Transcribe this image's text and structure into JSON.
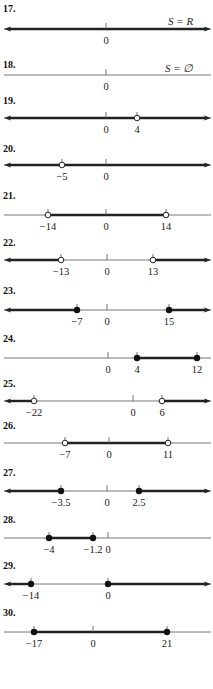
{
  "colors": {
    "axis": "#666666",
    "ray": "#222222",
    "dot": "#111111",
    "text": "#222222",
    "background": "#ffffff"
  },
  "problems": [
    {
      "number": "17.",
      "label_y": 12,
      "line_y": 29,
      "x0": 4,
      "x1": 211,
      "ticks": [
        {
          "x": 106,
          "label": "0"
        }
      ],
      "segments": [
        {
          "from": 4,
          "to": 211,
          "arrow_left": true,
          "arrow_right": true
        }
      ],
      "points": [],
      "annotation": {
        "text": "S = R",
        "x": 168,
        "y": 25
      }
    },
    {
      "number": "18.",
      "label_y": 68,
      "line_y": 75,
      "x0": 4,
      "x1": 211,
      "ticks": [
        {
          "x": 106,
          "label": "0"
        }
      ],
      "segments": [],
      "points": [],
      "annotation": {
        "text": "S = ∅",
        "x": 165,
        "y": 72
      }
    },
    {
      "number": "19.",
      "label_y": 104,
      "line_y": 118,
      "x0": 4,
      "x1": 211,
      "ticks": [
        {
          "x": 106,
          "label": "0"
        },
        {
          "x": 137,
          "label": "4"
        }
      ],
      "segments": [
        {
          "from": 4,
          "to": 211,
          "arrow_left": true,
          "arrow_right": true
        }
      ],
      "points": [
        {
          "x": 137,
          "type": "open"
        }
      ]
    },
    {
      "number": "20.",
      "label_y": 152,
      "line_y": 165,
      "x0": 4,
      "x1": 211,
      "ticks": [
        {
          "x": 62,
          "label": "−5"
        },
        {
          "x": 106,
          "label": "0"
        }
      ],
      "segments": [
        {
          "from": 4,
          "to": 211,
          "arrow_left": true,
          "arrow_right": true
        }
      ],
      "points": [
        {
          "x": 62,
          "type": "open"
        }
      ]
    },
    {
      "number": "21.",
      "label_y": 199,
      "line_y": 215,
      "x0": 4,
      "x1": 211,
      "ticks": [
        {
          "x": 48,
          "label": "−14"
        },
        {
          "x": 106,
          "label": "0"
        },
        {
          "x": 166,
          "label": "14"
        }
      ],
      "segments": [
        {
          "from": 48,
          "to": 166,
          "arrow_left": false,
          "arrow_right": false
        }
      ],
      "points": [
        {
          "x": 48,
          "type": "open"
        },
        {
          "x": 166,
          "type": "open"
        }
      ]
    },
    {
      "number": "22.",
      "label_y": 246,
      "line_y": 260,
      "x0": 4,
      "x1": 211,
      "ticks": [
        {
          "x": 61,
          "label": "−13"
        },
        {
          "x": 107,
          "label": "0"
        },
        {
          "x": 153,
          "label": "13"
        }
      ],
      "segments": [
        {
          "from": 4,
          "to": 61,
          "arrow_left": true,
          "arrow_right": false
        },
        {
          "from": 153,
          "to": 211,
          "arrow_left": false,
          "arrow_right": true
        }
      ],
      "points": [
        {
          "x": 61,
          "type": "open"
        },
        {
          "x": 153,
          "type": "open"
        }
      ]
    },
    {
      "number": "23.",
      "label_y": 294,
      "line_y": 310,
      "x0": 4,
      "x1": 211,
      "ticks": [
        {
          "x": 77,
          "label": "−7"
        },
        {
          "x": 107,
          "label": "0"
        },
        {
          "x": 169,
          "label": "15"
        }
      ],
      "segments": [
        {
          "from": 4,
          "to": 77,
          "arrow_left": true,
          "arrow_right": false
        },
        {
          "from": 169,
          "to": 211,
          "arrow_left": false,
          "arrow_right": true
        }
      ],
      "points": [
        {
          "x": 77,
          "type": "closed"
        },
        {
          "x": 169,
          "type": "closed"
        }
      ]
    },
    {
      "number": "24.",
      "label_y": 342,
      "line_y": 358,
      "x0": 4,
      "x1": 211,
      "ticks": [
        {
          "x": 108,
          "label": "0"
        },
        {
          "x": 137,
          "label": "4"
        },
        {
          "x": 197,
          "label": "12"
        }
      ],
      "segments": [
        {
          "from": 137,
          "to": 197,
          "arrow_left": false,
          "arrow_right": false
        }
      ],
      "points": [
        {
          "x": 137,
          "type": "closed"
        },
        {
          "x": 197,
          "type": "closed"
        }
      ]
    },
    {
      "number": "25.",
      "label_y": 387,
      "line_y": 401,
      "x0": 4,
      "x1": 211,
      "ticks": [
        {
          "x": 34,
          "label": "−22"
        },
        {
          "x": 133,
          "label": "0"
        },
        {
          "x": 162,
          "label": "6"
        }
      ],
      "segments": [
        {
          "from": 4,
          "to": 34,
          "arrow_left": true,
          "arrow_right": false
        },
        {
          "from": 162,
          "to": 211,
          "arrow_left": false,
          "arrow_right": true
        }
      ],
      "points": [
        {
          "x": 34,
          "type": "open"
        },
        {
          "x": 162,
          "type": "open"
        }
      ]
    },
    {
      "number": "26.",
      "label_y": 429,
      "line_y": 443,
      "x0": 4,
      "x1": 211,
      "ticks": [
        {
          "x": 65,
          "label": "−7"
        },
        {
          "x": 109,
          "label": "0"
        },
        {
          "x": 168,
          "label": "11"
        }
      ],
      "segments": [
        {
          "from": 65,
          "to": 168,
          "arrow_left": false,
          "arrow_right": false
        }
      ],
      "points": [
        {
          "x": 65,
          "type": "open"
        },
        {
          "x": 168,
          "type": "open"
        }
      ]
    },
    {
      "number": "27.",
      "label_y": 476,
      "line_y": 491,
      "x0": 4,
      "x1": 211,
      "ticks": [
        {
          "x": 61,
          "label": "−3.5"
        },
        {
          "x": 107,
          "label": "0"
        },
        {
          "x": 139,
          "label": "2.5"
        }
      ],
      "segments": [
        {
          "from": 4,
          "to": 61,
          "arrow_left": true,
          "arrow_right": false
        },
        {
          "from": 139,
          "to": 211,
          "arrow_left": false,
          "arrow_right": true
        }
      ],
      "points": [
        {
          "x": 61,
          "type": "closed"
        },
        {
          "x": 139,
          "type": "closed"
        }
      ]
    },
    {
      "number": "28.",
      "label_y": 523,
      "line_y": 538,
      "x0": 4,
      "x1": 211,
      "ticks": [
        {
          "x": 49,
          "label": "−4"
        },
        {
          "x": 93,
          "label": "−1.2"
        },
        {
          "x": 108,
          "label": "0"
        }
      ],
      "segments": [
        {
          "from": 49,
          "to": 93,
          "arrow_left": false,
          "arrow_right": false
        }
      ],
      "points": [
        {
          "x": 49,
          "type": "closed"
        },
        {
          "x": 93,
          "type": "closed"
        }
      ]
    },
    {
      "number": "29.",
      "label_y": 569,
      "line_y": 584,
      "x0": 4,
      "x1": 211,
      "ticks": [
        {
          "x": 31,
          "label": "−14"
        },
        {
          "x": 108,
          "label": "0"
        }
      ],
      "segments": [
        {
          "from": 4,
          "to": 31,
          "arrow_left": true,
          "arrow_right": false
        },
        {
          "from": 108,
          "to": 211,
          "arrow_left": false,
          "arrow_right": true
        }
      ],
      "points": [
        {
          "x": 31,
          "type": "closed"
        },
        {
          "x": 108,
          "type": "closed"
        }
      ]
    },
    {
      "number": "30.",
      "label_y": 616,
      "line_y": 632,
      "x0": 4,
      "x1": 211,
      "ticks": [
        {
          "x": 34,
          "label": "−17"
        },
        {
          "x": 93,
          "label": "0"
        },
        {
          "x": 167,
          "label": "21"
        }
      ],
      "segments": [
        {
          "from": 34,
          "to": 167,
          "arrow_left": false,
          "arrow_right": false
        }
      ],
      "points": [
        {
          "x": 34,
          "type": "closed"
        },
        {
          "x": 167,
          "type": "closed"
        }
      ]
    }
  ]
}
